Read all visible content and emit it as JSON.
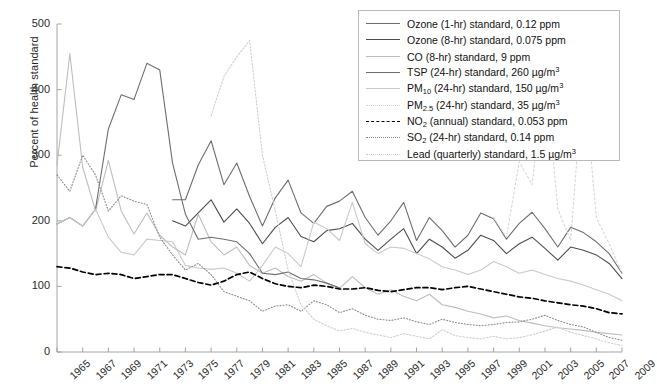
{
  "chart_data": {
    "type": "line",
    "title": "",
    "xlabel": "",
    "ylabel": "Percent of health standard",
    "xlim": [
      1965,
      2009
    ],
    "ylim": [
      0,
      500
    ],
    "ytick_values": [
      0,
      100,
      200,
      300,
      400,
      500
    ],
    "xtick_values": [
      1965,
      1967,
      1969,
      1971,
      1973,
      1975,
      1977,
      1979,
      1981,
      1983,
      1985,
      1987,
      1989,
      1991,
      1993,
      1995,
      1997,
      1999,
      2001,
      2003,
      2005,
      2007,
      2009
    ],
    "grid": false,
    "legend_position": "top-right",
    "series": [
      {
        "name": "Ozone (1-hr) standard, 0.12 ppm",
        "label_html": "Ozone (1-hr) standard, 0.12 ppm",
        "color": "#6e6e6e",
        "dash": "none",
        "width": 1.1,
        "x": [
          1974,
          1975,
          1976,
          1977,
          1978,
          1979,
          1980,
          1981,
          1982,
          1983,
          1984,
          1985,
          1986,
          1987,
          1988,
          1989,
          1990,
          1991,
          1992,
          1993,
          1994,
          1995,
          1996,
          1997,
          1998,
          1999,
          2000,
          2001,
          2002,
          2003,
          2004,
          2005,
          2006,
          2007,
          2008,
          2009
        ],
        "y": [
          232,
          232,
          285,
          322,
          255,
          288,
          237,
          192,
          235,
          262,
          212,
          196,
          222,
          230,
          245,
          205,
          178,
          200,
          228,
          170,
          205,
          185,
          160,
          178,
          212,
          203,
          172,
          196,
          213,
          188,
          160,
          190,
          182,
          168,
          150,
          120
        ]
      },
      {
        "name": "Ozone (8-hr) standard, 0.075 ppm",
        "label_html": "Ozone (8-hr) standard, 0.075 ppm",
        "color": "#4d4d4d",
        "dash": "none",
        "width": 1.1,
        "x": [
          1974,
          1975,
          1976,
          1977,
          1978,
          1979,
          1980,
          1981,
          1982,
          1983,
          1984,
          1985,
          1986,
          1987,
          1988,
          1989,
          1990,
          1991,
          1992,
          1993,
          1994,
          1995,
          1996,
          1997,
          1998,
          1999,
          2000,
          2001,
          2002,
          2003,
          2004,
          2005,
          2006,
          2007,
          2008,
          2009
        ],
        "y": [
          200,
          192,
          212,
          232,
          198,
          218,
          196,
          165,
          190,
          205,
          176,
          168,
          185,
          188,
          196,
          172,
          155,
          172,
          188,
          150,
          172,
          160,
          143,
          155,
          178,
          170,
          150,
          165,
          175,
          158,
          140,
          160,
          155,
          148,
          135,
          112
        ]
      },
      {
        "name": "CO (8-hr) standard, 9 ppm",
        "label_html": "CO (8-hr) standard, 9 ppm",
        "color": "#bdbdbd",
        "dash": "none",
        "width": 1.1,
        "x": [
          1965,
          1966,
          1967,
          1968,
          1969,
          1970,
          1971,
          1972,
          1973,
          1974,
          1975,
          1976,
          1977,
          1978,
          1979,
          1980,
          1981,
          1982,
          1983,
          1984,
          1985,
          1986,
          1987,
          1988,
          1989,
          1990,
          1991,
          1992,
          1993,
          1994,
          1995,
          1996,
          1997,
          1998,
          1999,
          2000,
          2001,
          2002,
          2003,
          2004,
          2005,
          2006,
          2007,
          2008,
          2009
        ],
        "y": [
          285,
          455,
          282,
          215,
          292,
          215,
          180,
          212,
          178,
          160,
          148,
          210,
          168,
          148,
          160,
          132,
          120,
          128,
          115,
          108,
          118,
          105,
          97,
          115,
          98,
          88,
          95,
          85,
          78,
          88,
          72,
          68,
          62,
          58,
          52,
          55,
          48,
          44,
          40,
          37,
          35,
          33,
          30,
          28,
          26
        ]
      },
      {
        "name": "TSP (24-hr) standard, 260 µg/m3",
        "label_html": "TSP (24-hr) standard, 260 µg/m<sup>3</sup>",
        "color": "#6e6e6e",
        "dash": "none",
        "width": 1.1,
        "x": [
          1965,
          1966,
          1967,
          1968,
          1969,
          1970,
          1971,
          1972,
          1973,
          1974,
          1975,
          1976,
          1977,
          1978,
          1979,
          1980,
          1981,
          1982,
          1983,
          1984,
          1985,
          1986,
          1987
        ],
        "y": [
          195,
          205,
          192,
          218,
          340,
          392,
          385,
          440,
          430,
          288,
          210,
          172,
          175,
          172,
          168,
          150,
          120,
          118,
          122,
          112,
          110,
          105,
          98
        ]
      },
      {
        "name": "PM10 (24-hr) standard, 150 µg/m3",
        "label_html": "PM<sub>10</sub> (24-hr) standard, 150 µg/m<sup>3</sup>",
        "color": "#c9c9c9",
        "dash": "none",
        "width": 1.1,
        "x": [
          1965,
          1966,
          1967,
          1968,
          1969,
          1970,
          1971,
          1972,
          1973,
          1974,
          1975,
          1976,
          1977,
          1978,
          1979,
          1980,
          1981,
          1982,
          1983,
          1984,
          1985,
          1986,
          1987,
          1988,
          1989,
          1990,
          1991,
          1992,
          1993,
          1994,
          1995,
          1996,
          1997,
          1998,
          1999,
          2000,
          2001,
          2002,
          2003,
          2004,
          2005,
          2006,
          2007,
          2008,
          2009
        ],
        "y": [
          195,
          205,
          192,
          218,
          175,
          152,
          148,
          172,
          170,
          168,
          132,
          128,
          126,
          128,
          120,
          108,
          132,
          160,
          150,
          130,
          198,
          188,
          170,
          228,
          165,
          150,
          160,
          158,
          150,
          142,
          130,
          125,
          118,
          125,
          138,
          130,
          120,
          125,
          118,
          112,
          108,
          102,
          95,
          88,
          78
        ]
      },
      {
        "name": "PM2.5 (24-hr) standard, 35 µg/m3",
        "label_html": "PM<sub>2.5</sub> (24-hr) standard, 35 µg/m<sup>3</sup>",
        "color": "#d5d5d5",
        "dash": "2,2.5",
        "width": 1.1,
        "x": [
          1999,
          2000,
          2001,
          2002,
          2003,
          2004,
          2005,
          2006,
          2007,
          2008,
          2009
        ],
        "y": [
          205,
          175,
          290,
          255,
          432,
          218,
          170,
          425,
          205,
          165,
          120
        ]
      },
      {
        "name": "NO2 (annual) standard, 0.053 ppm",
        "label_html": "NO<sub>2</sub> (annual) standard, 0.053 ppm",
        "color": "#000000",
        "dash": "5,3",
        "width": 1.7,
        "x": [
          1965,
          1966,
          1967,
          1968,
          1969,
          1970,
          1971,
          1972,
          1973,
          1974,
          1975,
          1976,
          1977,
          1978,
          1979,
          1980,
          1981,
          1982,
          1983,
          1984,
          1985,
          1986,
          1987,
          1988,
          1989,
          1990,
          1991,
          1992,
          1993,
          1994,
          1995,
          1996,
          1997,
          1998,
          1999,
          2000,
          2001,
          2002,
          2003,
          2004,
          2005,
          2006,
          2007,
          2008,
          2009
        ],
        "y": [
          130,
          128,
          122,
          118,
          120,
          118,
          112,
          115,
          118,
          118,
          112,
          106,
          102,
          108,
          118,
          122,
          112,
          104,
          100,
          98,
          102,
          100,
          96,
          96,
          98,
          94,
          92,
          95,
          98,
          98,
          95,
          98,
          100,
          96,
          92,
          88,
          84,
          82,
          78,
          75,
          72,
          70,
          66,
          60,
          58
        ]
      },
      {
        "name": "SO2 (24-hr) standard, 0.14 ppm",
        "label_html": "SO<sub>2</sub> (24-hr) standard, 0.14 ppm",
        "color": "#8a8a8a",
        "dash": "1,2",
        "width": 1.1,
        "x": [
          1965,
          1966,
          1967,
          1968,
          1969,
          1970,
          1971,
          1972,
          1973,
          1974,
          1975,
          1976,
          1977,
          1978,
          1979,
          1980,
          1981,
          1982,
          1983,
          1984,
          1985,
          1986,
          1987,
          1988,
          1989,
          1990,
          1991,
          1992,
          1993,
          1994,
          1995,
          1996,
          1997,
          1998,
          1999,
          2000,
          2001,
          2002,
          2003,
          2004,
          2005,
          2006,
          2007,
          2008,
          2009
        ],
        "y": [
          270,
          245,
          300,
          270,
          215,
          238,
          230,
          225,
          175,
          148,
          125,
          135,
          118,
          92,
          85,
          78,
          62,
          70,
          72,
          62,
          78,
          72,
          60,
          66,
          56,
          50,
          48,
          52,
          46,
          42,
          50,
          45,
          42,
          40,
          42,
          45,
          46,
          50,
          56,
          48,
          42,
          38,
          30,
          22,
          18
        ]
      },
      {
        "name": "Lead (quarterly) standard, 1.5 µg/m3",
        "label_html": "Lead (quarterly) standard, 1.5 µg/m<sup>3</sup>",
        "color": "#cfcfcf",
        "dash": "1.6,1.8",
        "width": 1.1,
        "x": [
          1977,
          1978,
          1979,
          1980,
          1981,
          1982,
          1983,
          1984,
          1985,
          1986,
          1987,
          1988,
          1989,
          1990,
          1991,
          1992,
          1993,
          1994,
          1995,
          1996,
          1997,
          1998,
          1999,
          2000,
          2001,
          2002,
          2003,
          2004,
          2005,
          2006,
          2007,
          2008,
          2009
        ],
        "y": [
          360,
          420,
          450,
          475,
          300,
          215,
          125,
          72,
          50,
          40,
          32,
          36,
          30,
          26,
          22,
          28,
          24,
          20,
          34,
          25,
          22,
          20,
          24,
          20,
          22,
          26,
          32,
          38,
          30,
          25,
          20,
          14,
          10
        ]
      }
    ]
  },
  "legend": {
    "items": [
      "Ozone (1-hr) standard, 0.12 ppm",
      "Ozone (8-hr) standard, 0.075 ppm",
      "CO (8-hr) standard, 9 ppm",
      "TSP (24-hr) standard, 260 µg/m3",
      "PM10 (24-hr) standard, 150 µg/m3",
      "PM2.5 (24-hr) standard, 35 µg/m3",
      "NO2 (annual) standard, 0.053 ppm",
      "SO2 (24-hr) standard, 0.14 ppm",
      "Lead (quarterly) standard, 1.5 µg/m3"
    ]
  },
  "axes": {
    "y_title": "Percent of health standard",
    "axis_color": "#9a9a9a"
  }
}
